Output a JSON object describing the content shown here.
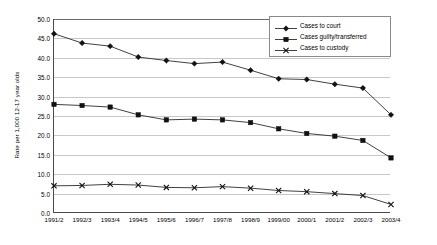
{
  "chart_data": {
    "type": "line",
    "title": "",
    "xlabel": "",
    "ylabel": "Rate per 1,000 12-17 year olds",
    "ylim": [
      0.0,
      50.0
    ],
    "ytick_step": 5.0,
    "grid": true,
    "legend_position": "top-right",
    "categories": [
      "1991/2",
      "1992/3",
      "1993/4",
      "1994/5",
      "1995/6",
      "1996/7",
      "1997/8",
      "1998/9",
      "1999/00",
      "2000/1",
      "2001/2",
      "2002/3",
      "2003/4"
    ],
    "ytick_labels": [
      "50.0",
      "45.0",
      "40.0",
      "35.0",
      "30.0",
      "25.0",
      "20.0",
      "15.0",
      "10.0",
      "5.0",
      "0.0"
    ],
    "ytick_values": [
      50.0,
      45.0,
      40.0,
      35.0,
      30.0,
      25.0,
      20.0,
      15.0,
      10.0,
      5.0,
      0.0
    ],
    "series": [
      {
        "name": "Cases to court",
        "marker": "diamond",
        "color": "#111111",
        "values": [
          46.2,
          43.8,
          43.0,
          40.2,
          39.3,
          38.5,
          38.9,
          36.8,
          34.6,
          34.4,
          33.2,
          32.2,
          25.3
        ]
      },
      {
        "name": "Cases guilty/transferred",
        "marker": "square",
        "color": "#111111",
        "values": [
          28.0,
          27.7,
          27.3,
          25.3,
          24.0,
          24.2,
          24.0,
          23.3,
          21.7,
          20.5,
          19.8,
          18.7,
          14.2
        ]
      },
      {
        "name": "Cases to custody",
        "marker": "cross",
        "color": "#111111",
        "values": [
          7.0,
          7.1,
          7.4,
          7.2,
          6.6,
          6.5,
          6.8,
          6.4,
          5.8,
          5.5,
          5.0,
          4.5,
          2.2
        ]
      }
    ]
  },
  "legend": {
    "entries": [
      {
        "label": "Cases to court",
        "marker": "diamond"
      },
      {
        "label": "Cases guilty/transferred",
        "marker": "square"
      },
      {
        "label": "Cases to custody",
        "marker": "cross"
      }
    ]
  }
}
